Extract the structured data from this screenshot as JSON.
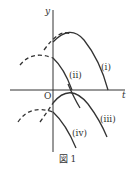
{
  "diagram": {
    "axes": {
      "y_label": "y",
      "x_label": "t",
      "origin_label": "O"
    },
    "curves": [
      {
        "label": "(i)"
      },
      {
        "label": "(ii)"
      },
      {
        "label": "(iii)"
      },
      {
        "label": "(iv)"
      }
    ],
    "caption": "図 1"
  }
}
